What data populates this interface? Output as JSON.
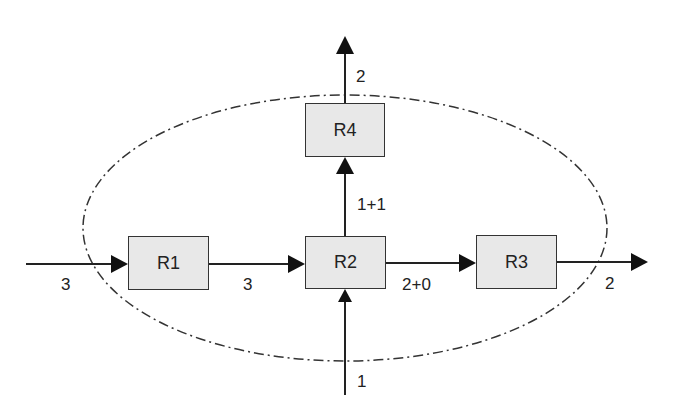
{
  "diagram": {
    "boundary": {
      "style": "dash-dot ellipse",
      "color": "#333333"
    },
    "nodes": [
      {
        "id": "R1",
        "label": "R1"
      },
      {
        "id": "R2",
        "label": "R2"
      },
      {
        "id": "R3",
        "label": "R3"
      },
      {
        "id": "R4",
        "label": "R4"
      }
    ],
    "edges": [
      {
        "from": "external-left",
        "to": "R1",
        "label": "3"
      },
      {
        "from": "R1",
        "to": "R2",
        "label": "3"
      },
      {
        "from": "R2",
        "to": "R4",
        "label": "1+1"
      },
      {
        "from": "R4",
        "to": "external-top",
        "label": "2"
      },
      {
        "from": "R2",
        "to": "R3",
        "label": "2+0"
      },
      {
        "from": "R3",
        "to": "external-right",
        "label": "2"
      },
      {
        "from": "external-bottom",
        "to": "R2",
        "label": "1"
      }
    ],
    "colors": {
      "node_fill": "#e8e8e8",
      "stroke": "#222222"
    }
  }
}
